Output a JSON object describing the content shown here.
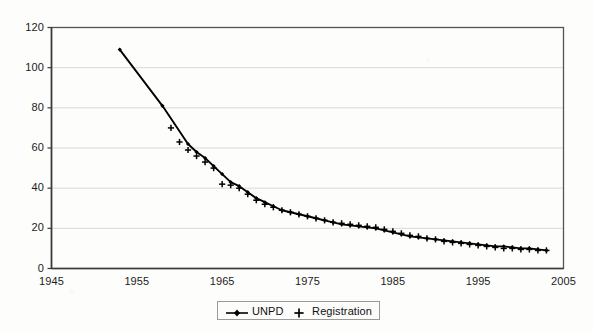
{
  "chart_data": {
    "type": "line",
    "title": "",
    "subtitle": "",
    "xlabel": "",
    "ylabel": "",
    "xlim": [
      1945,
      2005
    ],
    "ylim": [
      0,
      120
    ],
    "grid": "horizontal",
    "legend_position": "bottom",
    "xticks": [
      "1945",
      "1955",
      "1965",
      "1975",
      "1985",
      "1995",
      "2005"
    ],
    "xtick_values": [
      1945,
      1955,
      1965,
      1975,
      1985,
      1995,
      2005
    ],
    "yticks": [
      "0",
      "20",
      "40",
      "60",
      "80",
      "100",
      "120"
    ],
    "ytick_values": [
      0,
      20,
      40,
      60,
      80,
      100,
      120
    ],
    "series": [
      {
        "name": "UNPD",
        "marker": "diamond",
        "line": true,
        "color": "#000000",
        "x": [
          1953,
          1958,
          1961,
          1962,
          1963,
          1964,
          1965,
          1966,
          1967,
          1968,
          1969,
          1970,
          1971,
          1972,
          1973,
          1974,
          1975,
          1976,
          1977,
          1978,
          1979,
          1980,
          1981,
          1982,
          1983,
          1984,
          1985,
          1986,
          1987,
          1988,
          1989,
          1990,
          1991,
          1992,
          1993,
          1994,
          1995,
          1996,
          1997,
          1998,
          1999,
          2000,
          2001,
          2002,
          2003
        ],
        "y": [
          109,
          81,
          62,
          58,
          55,
          51,
          47,
          43,
          41,
          38,
          35,
          33,
          31,
          29,
          28,
          27,
          26,
          25,
          24,
          23,
          22,
          21.5,
          21,
          20.5,
          20,
          19,
          18,
          17,
          16,
          15.5,
          15,
          14.5,
          14,
          13.5,
          13,
          12.5,
          12,
          11.5,
          11,
          11,
          10.5,
          10,
          10,
          9.5,
          9
        ]
      },
      {
        "name": "Registration",
        "marker": "plus",
        "line": false,
        "color": "#000000",
        "x": [
          1959,
          1960,
          1961,
          1962,
          1963,
          1964,
          1965,
          1966,
          1967,
          1968,
          1969,
          1970,
          1971,
          1972,
          1973,
          1974,
          1975,
          1976,
          1977,
          1978,
          1979,
          1980,
          1981,
          1982,
          1983,
          1984,
          1985,
          1986,
          1987,
          1988,
          1989,
          1990,
          1991,
          1992,
          1993,
          1994,
          1995,
          1996,
          1997,
          1998,
          1999,
          2000,
          2001,
          2002,
          2003
        ],
        "y": [
          70,
          63,
          59,
          56,
          53,
          50,
          42,
          41.5,
          40,
          37,
          34,
          32,
          30.5,
          29,
          28,
          27,
          26,
          25,
          24,
          23,
          22.5,
          22,
          21.5,
          21,
          20.5,
          19.5,
          18.5,
          17.5,
          16.5,
          16,
          15,
          14.5,
          13.5,
          13,
          12.5,
          12,
          11.5,
          11,
          10.5,
          10,
          10,
          9.5,
          9.5,
          9,
          9
        ]
      }
    ]
  },
  "legend": {
    "entries": [
      {
        "label": "UNPD",
        "symbol": "line-diamond-marker"
      },
      {
        "label": "Registration",
        "symbol": "plus-marker"
      }
    ]
  },
  "colors": {
    "axis": "#555555",
    "grid": "#d9d9d9",
    "data": "#000000",
    "background": "#fdfdfb"
  }
}
